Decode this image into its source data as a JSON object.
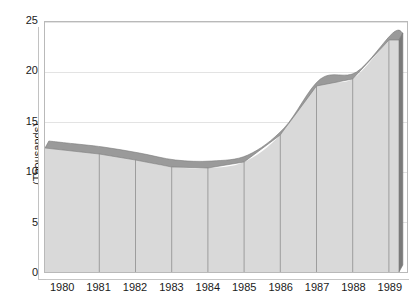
{
  "chart_data": {
    "type": "area",
    "title": "",
    "xlabel": "",
    "ylabel": "(Thousands)",
    "categories": [
      "1980",
      "1981",
      "1982",
      "1983",
      "1984",
      "1985",
      "1986",
      "1987",
      "1988",
      "1989"
    ],
    "values": [
      12.2,
      11.8,
      11.2,
      10.5,
      10.4,
      11.0,
      13.7,
      18.6,
      19.3,
      23.2
    ],
    "series": [
      {
        "name": "",
        "values": [
          12.2,
          11.8,
          11.2,
          10.5,
          10.4,
          11.0,
          13.7,
          18.6,
          19.3,
          23.2
        ]
      }
    ],
    "ylim": [
      0,
      25
    ],
    "yticks": [
      "0",
      "5",
      "10",
      "15",
      "20",
      "25"
    ],
    "ytick_values": [
      0,
      5,
      10,
      15,
      20,
      25
    ],
    "grid": true,
    "legend": "none",
    "style": "3d-area",
    "colors": {
      "fill": "#d9d9d9",
      "top_ribbon": "#9a9a9a",
      "side_face": "#7a7a7a",
      "gridline": "#e3e3e3",
      "axis": "#b9b9b9",
      "text": "#1a1a1a",
      "column_separator": "#8e8e8e"
    }
  },
  "axes": {
    "y_title": "(Thousands)"
  }
}
